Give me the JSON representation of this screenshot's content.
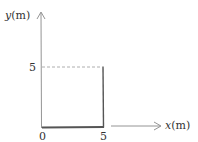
{
  "diagram": {
    "y_axis": {
      "label_var": "y",
      "label_unit": "(m)"
    },
    "x_axis": {
      "label_var": "x",
      "label_unit": "(m)"
    },
    "ticks": {
      "y_tick": "5",
      "origin": "0",
      "x_tick": "5"
    },
    "colors": {
      "axis": "#888888",
      "path": "#555555",
      "dashed": "#999999",
      "text": "#333333"
    }
  }
}
